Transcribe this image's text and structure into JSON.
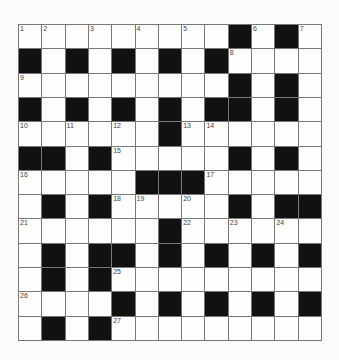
{
  "puzzle": {
    "rows": 13,
    "cols": 13,
    "grid": [
      [
        "1",
        "2",
        "",
        "3",
        "",
        "4",
        "",
        "5",
        "",
        "#",
        "6",
        "#",
        "7"
      ],
      [
        "#",
        "",
        "#",
        "",
        "#",
        "",
        "#",
        "",
        "#",
        "8",
        "",
        "",
        ""
      ],
      [
        "9",
        "",
        "",
        "",
        "",
        "",
        "",
        "",
        "",
        "#",
        "",
        "#",
        ""
      ],
      [
        "#",
        "",
        "#",
        "",
        "#",
        "",
        "#",
        "",
        "#",
        "#",
        "",
        "#",
        ""
      ],
      [
        "10",
        "",
        "11",
        "",
        "12",
        "",
        "#",
        "13",
        "14",
        "",
        "",
        "",
        ""
      ],
      [
        "#",
        "#",
        "",
        "#",
        "15",
        "",
        "",
        "",
        "",
        "#",
        "",
        "#",
        ""
      ],
      [
        "16",
        "",
        "",
        "",
        "",
        "#",
        "#",
        "#",
        "17",
        "",
        "",
        "",
        ""
      ],
      [
        "",
        "#",
        "",
        "#",
        "18",
        "19",
        "",
        "20",
        "",
        "#",
        "",
        "#",
        "#"
      ],
      [
        "21",
        "",
        "",
        "",
        "",
        "",
        "#",
        "22",
        "",
        "23",
        "",
        "24",
        ""
      ],
      [
        "",
        "#",
        "",
        "#",
        "#",
        "",
        "#",
        "",
        "#",
        "",
        "#",
        "",
        "#"
      ],
      [
        "",
        "#",
        "",
        "#",
        "25",
        "",
        "",
        "",
        "",
        "",
        "",
        "",
        ""
      ],
      [
        "26",
        "",
        "",
        "",
        "#",
        "",
        "#",
        "",
        "#",
        "",
        "#",
        "",
        "#"
      ],
      [
        "",
        "#",
        "",
        "#",
        "27",
        "",
        "",
        "",
        "",
        "",
        "",
        "",
        ""
      ]
    ],
    "colors": {
      "block": "#111111",
      "cell": "#fdfdfc",
      "line": "#777777",
      "number": "#444444"
    }
  }
}
